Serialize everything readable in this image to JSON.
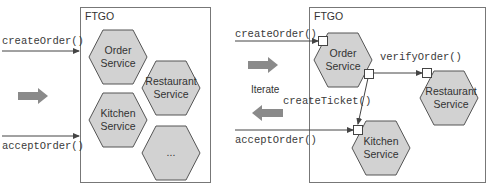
{
  "colors": {
    "hex_fill": "#d2d2d2",
    "hex_stroke": "#555555",
    "box_stroke": "#777777",
    "arrow": "#444444",
    "fat_arrow": "#8a8a8a",
    "port_fill": "#ffffff"
  },
  "left_panel": {
    "box_label": "FTGO",
    "incoming": [
      {
        "label": "createOrder()"
      },
      {
        "label": "acceptOrder()"
      }
    ],
    "services": [
      {
        "line1": "Order",
        "line2": "Service"
      },
      {
        "line1": "Restaurant",
        "line2": "Service"
      },
      {
        "line1": "Kitchen",
        "line2": "Service"
      },
      {
        "line1": "...",
        "line2": ""
      }
    ]
  },
  "middle": {
    "iterate_label": "Iterate"
  },
  "right_panel": {
    "box_label": "FTGO",
    "incoming": [
      {
        "label": "createOrder()"
      },
      {
        "label": "acceptOrder()"
      }
    ],
    "internal_calls": [
      {
        "label": "verifyOrder()"
      },
      {
        "label": "createTicket()"
      }
    ],
    "services": [
      {
        "line1": "Order",
        "line2": "Service"
      },
      {
        "line1": "Restaurant",
        "line2": "Service"
      },
      {
        "line1": "Kitchen",
        "line2": "Service"
      }
    ]
  }
}
